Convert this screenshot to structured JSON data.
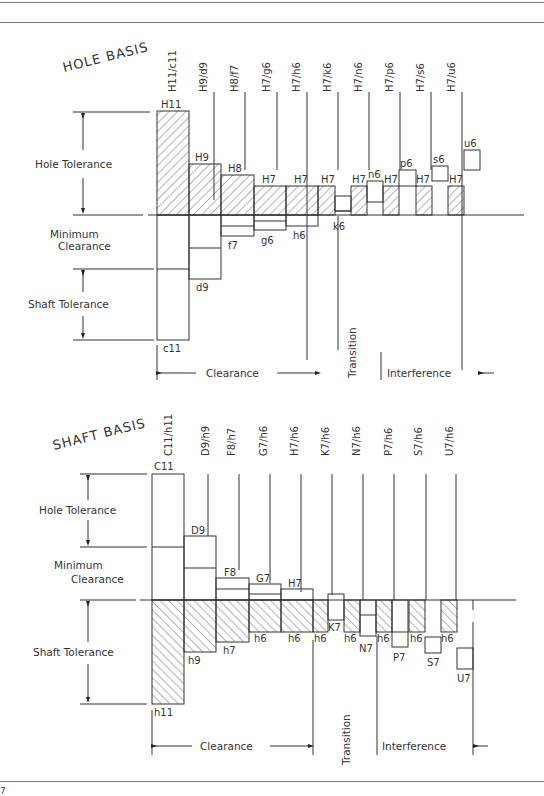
{
  "page_number": "7",
  "hole_basis": {
    "title": "HOLE BASIS",
    "side_labels": {
      "hole_tolerance": "Hole Tolerance",
      "minimum_clearance_line1": "Minimum",
      "minimum_clearance_line2": "Clearance",
      "shaft_tolerance": "Shaft Tolerance"
    },
    "fits": [
      "H11/c11",
      "H9/d9",
      "H8/f7",
      "H7/g6",
      "H7/h6",
      "H7/k6",
      "H7/n6",
      "H7/p6",
      "H7/s6",
      "H7/u6"
    ],
    "hole_labels": [
      "H11",
      "H9",
      "H8",
      "H7",
      "H7",
      "H7",
      "H7",
      "H7",
      "H7",
      "H7"
    ],
    "shaft_labels": [
      "c11",
      "d9",
      "f7",
      "g6",
      "h6",
      "k6",
      "n6",
      "p6",
      "s6",
      "u6"
    ],
    "zones": {
      "clearance": "Clearance",
      "transition": "Transition",
      "interference": "Interference"
    }
  },
  "shaft_basis": {
    "title": "SHAFT BASIS",
    "side_labels": {
      "hole_tolerance": "Hole Tolerance",
      "minimum_clearance_line1": "Minimum",
      "minimum_clearance_line2": "Clearance",
      "shaft_tolerance": "Shaft Tolerance"
    },
    "fits": [
      "C11/h11",
      "D9/h9",
      "F8/h7",
      "G7/h6",
      "H7/h6",
      "K7/h6",
      "N7/h6",
      "P7/h6",
      "S7/h6",
      "U7/h6"
    ],
    "hole_labels": [
      "C11",
      "D9",
      "F8",
      "G7",
      "H7",
      "K7",
      "N7",
      "P7",
      "S7",
      "U7"
    ],
    "shaft_labels": [
      "h11",
      "h9",
      "h7",
      "h6",
      "h6",
      "h6",
      "h6",
      "h6",
      "h6",
      "h6"
    ],
    "zones": {
      "clearance": "Clearance",
      "transition": "Transition",
      "interference": "Interference"
    }
  }
}
